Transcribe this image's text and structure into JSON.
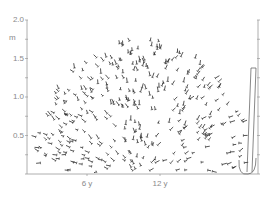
{
  "figure": {
    "type": "botanical-growth-diagram",
    "y_axis": {
      "unit_label": "m",
      "ticks": [
        {
          "label": "2.0",
          "value": 2.0
        },
        {
          "label": "1.5",
          "value": 1.5
        },
        {
          "label": "1.0",
          "value": 1.0
        },
        {
          "label": "0.5",
          "value": 0.5
        }
      ],
      "minor_step": 0.25,
      "range": [
        0,
        2.0
      ]
    },
    "x_axis": {
      "ticks": [
        {
          "label": "6 y"
        },
        {
          "label": "12 y"
        }
      ]
    },
    "subjects": [
      {
        "name": "mature shrub crown",
        "approx_height_m": 1.8,
        "age_label": "12 y"
      },
      {
        "name": "young narrow plant outline",
        "approx_height_m": 1.5
      }
    ],
    "colors": {
      "axis": "#9a9a9a",
      "label": "#8a8a8a",
      "foliage": "#2a2a2a",
      "outline": "#555555",
      "background": "#ffffff"
    }
  }
}
